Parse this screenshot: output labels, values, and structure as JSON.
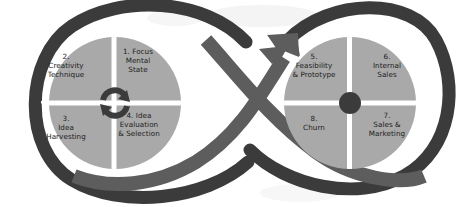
{
  "diagram": {
    "type": "infinity-loop-process",
    "colors": {
      "background": "#ffffff",
      "ribbon_dark": "#3b3b3b",
      "ribbon_mid": "#5d5d5d",
      "circle_fill": "#a9a9a9",
      "divider": "#ffffff",
      "text": "#1c1c1c",
      "center_dot": "#3b3b3b",
      "cycle_icon": "#3b3b3b",
      "watermark": "#f2f2f2"
    },
    "left_loop": {
      "name": "ideation-loop",
      "center_icon": "cycle-refresh-icon",
      "quadrants": [
        {
          "id": "q1",
          "position": "top-right",
          "number": "1.",
          "label": "1. Focus\nMental\nState"
        },
        {
          "id": "q2",
          "position": "top-left",
          "number": "2.",
          "label": "2.\nCreativity\nTechnique"
        },
        {
          "id": "q3",
          "position": "bottom-left",
          "number": "3.",
          "label": "3.\nIdea\nHarvesting"
        },
        {
          "id": "q4",
          "position": "bottom-right",
          "number": "4.",
          "label": "4. Idea\nEvaluation\n& Selection"
        }
      ]
    },
    "right_loop": {
      "name": "commercialization-loop",
      "center_icon": "center-dot-icon",
      "quadrants": [
        {
          "id": "q5",
          "position": "top-left",
          "number": "5.",
          "label": "5.\nFeasibility\n& Prototype"
        },
        {
          "id": "q6",
          "position": "top-right",
          "number": "6.",
          "label": "6.\nInternal\nSales"
        },
        {
          "id": "q7",
          "position": "bottom-right",
          "number": "7.",
          "label": "7.\nSales &\nMarketing"
        },
        {
          "id": "q8",
          "position": "bottom-left",
          "number": "8.",
          "label": "8.\nChurn"
        }
      ]
    },
    "arrow": {
      "name": "transition-arrow",
      "direction": "up-right",
      "from": "left-loop",
      "to": "right-loop"
    }
  }
}
